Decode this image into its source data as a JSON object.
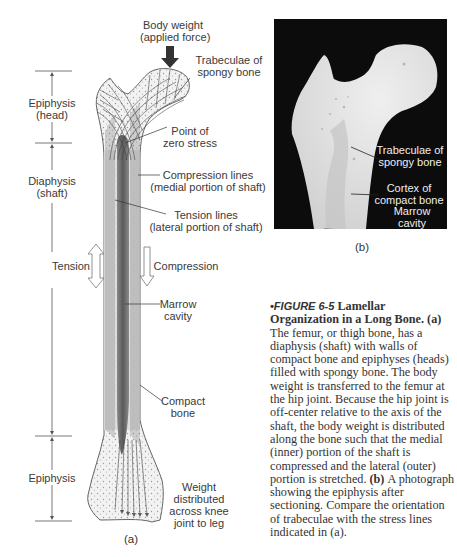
{
  "figure_a": {
    "labels": {
      "body_weight": [
        "Body weight",
        "(applied force)"
      ],
      "trabeculae": [
        "Trabeculae of",
        "spongy bone"
      ],
      "point_zero": [
        "Point of",
        "zero stress"
      ],
      "compression_lines": [
        "Compression lines",
        "(medial portion of shaft)"
      ],
      "tension_lines": [
        "Tension lines",
        "(lateral portion of shaft)"
      ],
      "tension": "Tension",
      "compression": "Compression",
      "marrow": [
        "Marrow",
        "cavity"
      ],
      "compact": [
        "Compact",
        "bone"
      ],
      "weight_distributed": [
        "Weight",
        "distributed",
        "across knee",
        "joint to leg"
      ],
      "epiphysis_head": [
        "Epiphysis",
        "(head)"
      ],
      "diaphysis": [
        "Diaphysis",
        "(shaft)"
      ],
      "epiphysis": "Epiphysis"
    },
    "sublabel": "(a)"
  },
  "figure_b": {
    "labels": {
      "trabeculae": [
        "Trabeculae of",
        "spongy bone"
      ],
      "cortex": [
        "Cortex of",
        "compact bone"
      ],
      "marrow": [
        "Marrow",
        "cavity"
      ]
    },
    "sublabel": "(b)"
  },
  "caption": {
    "figure_number": "•FIGURE 6-5",
    "title": "Lamellar Organization in a Long Bone.",
    "part_a_marker": "(a)",
    "part_a_text": "The femur, or thigh bone, has a diaphysis (shaft) with walls of compact bone and epiphyses (heads) filled with spongy bone. The body weight is transferred to the femur at the hip joint. Because the hip joint is off-center relative to the axis of the shaft, the body weight is distributed along the bone such that the medial (inner) portion of the shaft is compressed and the lateral (outer) portion is stretched.",
    "part_b_marker": "(b)",
    "part_b_text": "A photograph showing the epiphysis after sectioning. Compare the orientation of trabeculae with the stress lines indicated in (a)."
  }
}
